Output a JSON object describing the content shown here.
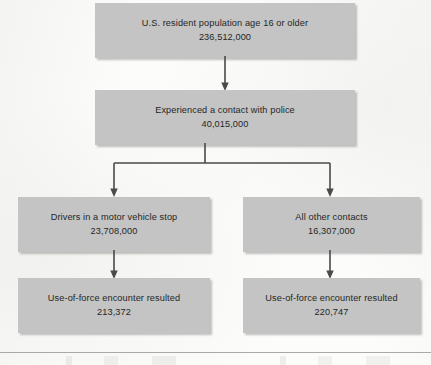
{
  "diagram": {
    "type": "flowchart",
    "orientation": "top-down",
    "background_color": "#fcfcfb",
    "node_fill_color": "#c3c4c3",
    "connector_color": "#4a4a4a",
    "rule_color": "#a9a9a7",
    "nodes": [
      {
        "id": "population",
        "label": "U.S. resident population age 16 or older",
        "value": "236,512,000"
      },
      {
        "id": "contact",
        "label": "Experienced a contact with police",
        "value": "40,015,000"
      },
      {
        "id": "drivers",
        "label": "Drivers in a motor vehicle stop",
        "value": "23,708,000"
      },
      {
        "id": "other_contacts",
        "label": "All other contacts",
        "value": "16,307,000"
      },
      {
        "id": "force_left",
        "label": "Use-of-force encounter resulted",
        "value": "213,372"
      },
      {
        "id": "force_right",
        "label": "Use-of-force encounter resulted",
        "value": "220,747"
      }
    ],
    "edges": [
      {
        "id": "population-to-contact",
        "from": "population",
        "to": "contact",
        "style": "arrow-down"
      },
      {
        "id": "contact-to-drivers",
        "from": "contact",
        "to": "drivers",
        "style": "split-arrow-down-left"
      },
      {
        "id": "contact-to-other",
        "from": "contact",
        "to": "other_contacts",
        "style": "split-arrow-down-right"
      },
      {
        "id": "drivers-to-force",
        "from": "drivers",
        "to": "force_left",
        "style": "arrow-down"
      },
      {
        "id": "other-to-force",
        "from": "other_contacts",
        "to": "force_right",
        "style": "arrow-down"
      }
    ]
  }
}
